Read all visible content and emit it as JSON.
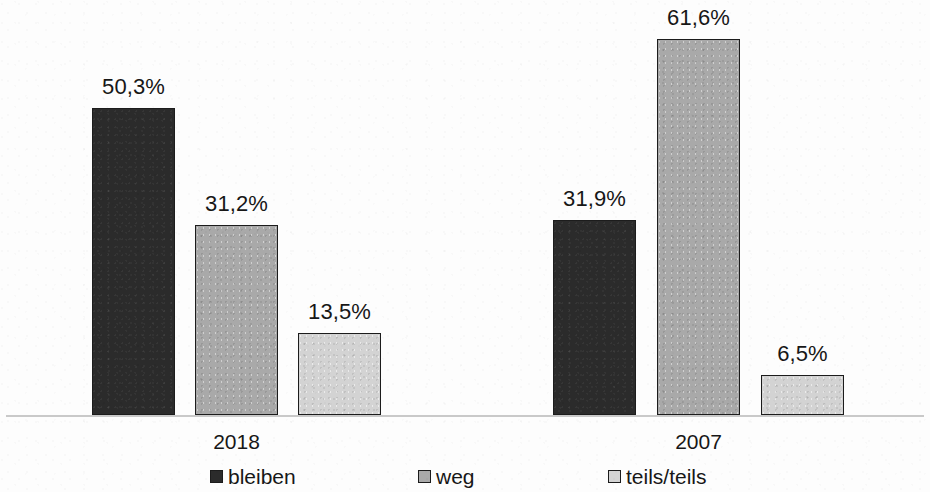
{
  "chart_data": {
    "type": "bar",
    "title": "",
    "subtitle": "",
    "xlabel": "",
    "ylabel": "",
    "categories": [
      "2018",
      "2007"
    ],
    "series": [
      {
        "name": "bleiben",
        "color": "#2b2b2b",
        "values": [
          50.3,
          31.9
        ],
        "labels": [
          "50,3%",
          "31,9%"
        ]
      },
      {
        "name": "weg",
        "color": "#a9a9a9",
        "values": [
          31.2,
          61.6
        ],
        "labels": [
          "31,2%",
          "61,6%"
        ]
      },
      {
        "name": "teils/teils",
        "color": "#d3d3d3",
        "values": [
          13.5,
          6.5
        ],
        "labels": [
          "13,5%",
          "6,5%"
        ]
      }
    ],
    "ylim": [
      0,
      66
    ],
    "grid": false,
    "axis_visible": true,
    "y_ticks_visible": false,
    "legend_position": "bottom",
    "value_labels_shown": true,
    "decimal_separator": ","
  },
  "legend": {
    "items": [
      {
        "label": "bleiben",
        "swatch": "dark-square-swatch"
      },
      {
        "label": "weg",
        "swatch": "medium-gray-square-swatch"
      },
      {
        "label": "teils/teils",
        "swatch": "light-gray-square-swatch"
      }
    ]
  },
  "axis": {
    "group_labels": [
      "2018",
      "2007"
    ]
  },
  "bars": [
    {
      "group": "2018",
      "series": "bleiben",
      "label": "50,3%",
      "value": 50.3
    },
    {
      "group": "2018",
      "series": "weg",
      "label": "31,2%",
      "value": 31.2
    },
    {
      "group": "2018",
      "series": "teils/teils",
      "label": "13,5%",
      "value": 13.5
    },
    {
      "group": "2007",
      "series": "bleiben",
      "label": "31,9%",
      "value": 31.9
    },
    {
      "group": "2007",
      "series": "weg",
      "label": "61,6%",
      "value": 61.6
    },
    {
      "group": "2007",
      "series": "teils/teils",
      "label": "6,5%",
      "value": 6.5
    }
  ]
}
